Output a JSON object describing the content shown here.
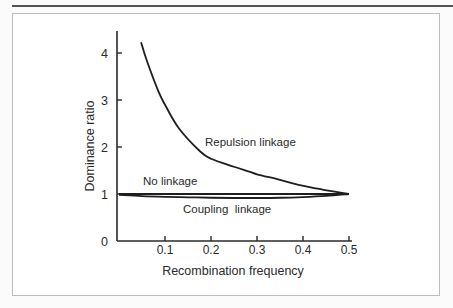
{
  "chart_data": {
    "type": "line",
    "title": "",
    "xlabel": "Recombination frequency",
    "ylabel": "Dominance ratio",
    "xlim": [
      0,
      0.5
    ],
    "ylim": [
      0,
      4.5
    ],
    "x_ticks": [
      0.1,
      0.2,
      0.3,
      0.4,
      0.5
    ],
    "x_tick_labels": [
      "0.1",
      "0.2",
      "0.3",
      "0.4",
      "0.5"
    ],
    "y_ticks": [
      0,
      1,
      2,
      3,
      4
    ],
    "y_tick_labels": [
      "0",
      "1",
      "2",
      "3",
      "4"
    ],
    "grid": false,
    "legend": "none (inline curve labels)",
    "series": [
      {
        "name": "Repulsion linkage",
        "label": "Repulsion linkage",
        "x": [
          0.048,
          0.06,
          0.085,
          0.1,
          0.13,
          0.176,
          0.2,
          0.25,
          0.285,
          0.3,
          0.35,
          0.393,
          0.44,
          0.5
        ],
        "y": [
          4.23,
          3.85,
          3.2,
          2.9,
          2.4,
          1.91,
          1.75,
          1.58,
          1.47,
          1.42,
          1.3,
          1.19,
          1.1,
          1.0
        ]
      },
      {
        "name": "No linkage",
        "label": "No linkage",
        "x": [
          0,
          0.5
        ],
        "y": [
          1.0,
          1.0
        ]
      },
      {
        "name": "Coupling linkage",
        "label": "Coupling  linkage",
        "x": [
          0,
          0.05,
          0.1,
          0.15,
          0.2,
          0.25,
          0.3,
          0.35,
          0.4,
          0.45,
          0.5
        ],
        "y": [
          0.98,
          0.955,
          0.94,
          0.93,
          0.92,
          0.915,
          0.915,
          0.92,
          0.935,
          0.96,
          1.0
        ]
      }
    ]
  }
}
